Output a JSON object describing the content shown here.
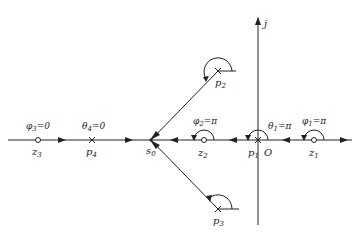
{
  "diagram": {
    "axis_labels": {
      "imag": "j",
      "origin": "O"
    },
    "points": {
      "z3": {
        "label": "z",
        "sub": "3",
        "kind": "zero"
      },
      "p4": {
        "label": "p",
        "sub": "4",
        "kind": "pole"
      },
      "s0": {
        "label": "s",
        "sub": "0",
        "kind": "test-point"
      },
      "z2": {
        "label": "z",
        "sub": "2",
        "kind": "zero"
      },
      "p1": {
        "label": "p",
        "sub": "1",
        "kind": "pole"
      },
      "z1": {
        "label": "z",
        "sub": "1",
        "kind": "zero"
      },
      "p2": {
        "label": "p",
        "sub": "2",
        "kind": "pole"
      },
      "p3": {
        "label": "p",
        "sub": "3",
        "kind": "pole"
      }
    },
    "angles": {
      "phi3": {
        "sym": "φ",
        "sub": "3",
        "value": "=0"
      },
      "theta4": {
        "sym": "θ",
        "sub": "4",
        "value": "=0"
      },
      "phi2": {
        "sym": "φ",
        "sub": "2",
        "value": "=π"
      },
      "theta1": {
        "sym": "θ",
        "sub": "1",
        "value": "=π"
      },
      "phi1": {
        "sym": "φ",
        "sub": "1",
        "value": "=π"
      }
    }
  }
}
